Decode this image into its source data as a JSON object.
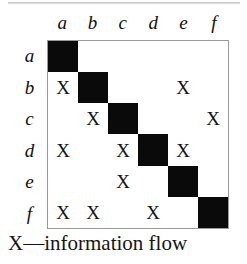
{
  "figure": {
    "kind": "design-structure-matrix",
    "caption": "X—information flow",
    "legend_symbol": "X",
    "legend_meaning": "information flow"
  },
  "matrix": {
    "column_headers": [
      "a",
      "b",
      "c",
      "d",
      "e",
      "f"
    ],
    "row_headers": [
      "a",
      "b",
      "c",
      "d",
      "e",
      "f"
    ],
    "mark": "X",
    "diagonal_fill": "#0b0a0a",
    "border_color": "#9a9a9a",
    "background": "#ffffff",
    "rows": [
      {
        "label": "a",
        "cells": [
          "",
          "",
          "",
          "",
          "",
          ""
        ]
      },
      {
        "label": "b",
        "cells": [
          "X",
          "",
          "",
          "",
          "X",
          ""
        ]
      },
      {
        "label": "c",
        "cells": [
          "",
          "X",
          "",
          "",
          "",
          "X"
        ]
      },
      {
        "label": "d",
        "cells": [
          "X",
          "",
          "X",
          "",
          "X",
          ""
        ]
      },
      {
        "label": "e",
        "cells": [
          "",
          "",
          "X",
          "",
          "",
          ""
        ]
      },
      {
        "label": "f",
        "cells": [
          "X",
          "X",
          "",
          "X",
          "",
          ""
        ]
      }
    ]
  },
  "chart_data": {
    "type": "heatmap",
    "title": "",
    "xlabel": "",
    "ylabel": "",
    "categories": [
      "a",
      "b",
      "c",
      "d",
      "e",
      "f"
    ],
    "x": [
      "a",
      "b",
      "c",
      "d",
      "e",
      "f"
    ],
    "y": [
      "a",
      "b",
      "c",
      "d",
      "e",
      "f"
    ],
    "legend": [
      "X—information flow"
    ],
    "grid": true,
    "values": [
      [
        2,
        0,
        0,
        0,
        0,
        0
      ],
      [
        1,
        2,
        0,
        0,
        1,
        0
      ],
      [
        0,
        1,
        2,
        0,
        0,
        1
      ],
      [
        1,
        0,
        1,
        2,
        1,
        0
      ],
      [
        0,
        0,
        1,
        0,
        2,
        0
      ],
      [
        1,
        1,
        0,
        1,
        0,
        2
      ]
    ],
    "marks": [
      {
        "row": "b",
        "col": "a"
      },
      {
        "row": "b",
        "col": "e"
      },
      {
        "row": "c",
        "col": "b"
      },
      {
        "row": "c",
        "col": "f"
      },
      {
        "row": "d",
        "col": "a"
      },
      {
        "row": "d",
        "col": "c"
      },
      {
        "row": "d",
        "col": "e"
      },
      {
        "row": "e",
        "col": "c"
      },
      {
        "row": "f",
        "col": "a"
      },
      {
        "row": "f",
        "col": "b"
      },
      {
        "row": "f",
        "col": "d"
      }
    ]
  }
}
